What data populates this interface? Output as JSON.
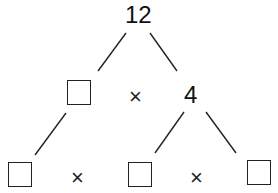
{
  "diagram": {
    "type": "factor-tree",
    "root": {
      "label": "12"
    },
    "level2": {
      "left": {
        "label": ""
      },
      "operator": "×",
      "right": {
        "label": "4"
      }
    },
    "level3": {
      "left": {
        "label": ""
      },
      "operator_left": "×",
      "middle": {
        "label": ""
      },
      "operator_right": "×",
      "right": {
        "label": ""
      }
    },
    "colors": {
      "stroke": "#222222",
      "background": "#ffffff"
    }
  }
}
